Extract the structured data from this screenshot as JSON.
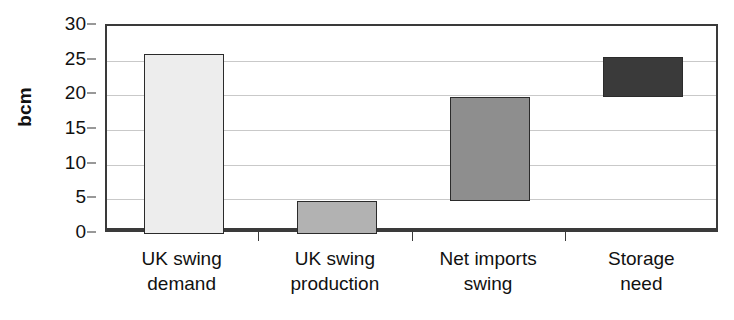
{
  "chart_data": {
    "type": "bar",
    "subtype": "floating-waterfall",
    "title": "",
    "xlabel": "",
    "ylabel": "bcm",
    "ylim": [
      0,
      30
    ],
    "ytick_step": 5,
    "yticks": [
      30,
      25,
      20,
      15,
      10,
      5,
      0
    ],
    "grid": true,
    "legend": "none",
    "categories": [
      "UK swing demand",
      "UK swing production",
      "Net imports swing",
      "Storage need"
    ],
    "bars": [
      {
        "label": "UK swing demand",
        "line1": "UK swing",
        "line2": "demand",
        "base": 0.0,
        "top": 25.9,
        "value": 25.9,
        "color": "#ededed"
      },
      {
        "label": "UK swing production",
        "line1": "UK swing",
        "line2": "production",
        "base": 0.0,
        "top": 4.8,
        "value": 4.8,
        "color": "#b2b2b2"
      },
      {
        "label": "Net imports swing",
        "line1": "Net imports",
        "line2": "swing",
        "base": 4.8,
        "top": 19.8,
        "value": 15.0,
        "color": "#8e8e8e"
      },
      {
        "label": "Storage need",
        "line1": "Storage",
        "line2": "need",
        "base": 19.8,
        "top": 25.5,
        "value": 5.7,
        "color": "#3a3a3a"
      }
    ],
    "values": [
      25.9,
      4.8,
      15.0,
      5.7
    ],
    "colors": {
      "axis": "#3a3a3a",
      "grid": "#c9c9c9",
      "bar_outline": "#2b2b2b",
      "text": "#111111",
      "background": "#ffffff"
    }
  }
}
